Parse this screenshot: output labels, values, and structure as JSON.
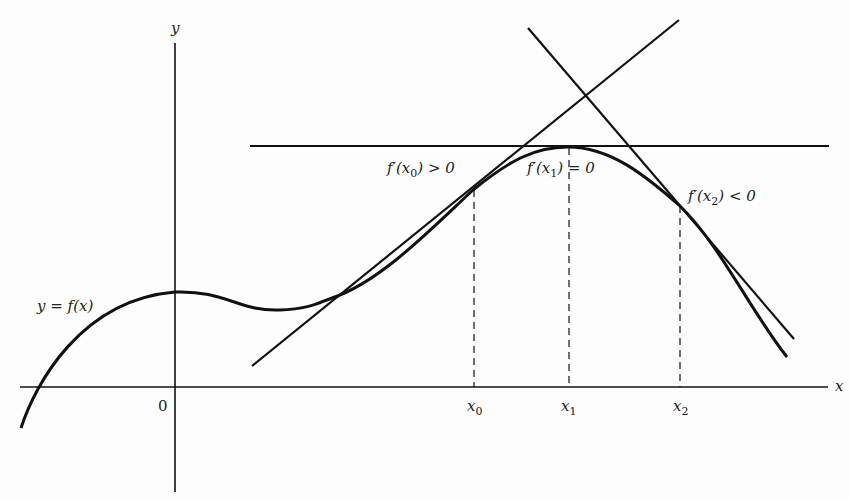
{
  "figure": {
    "axes": {
      "x_label": "x",
      "y_label": "y",
      "origin_label": "0"
    },
    "curve": {
      "label": "y = f(x)"
    },
    "points": [
      {
        "name": "x0",
        "label_base": "x",
        "label_sub": "0"
      },
      {
        "name": "x1",
        "label_base": "x",
        "label_sub": "1"
      },
      {
        "name": "x2",
        "label_base": "x",
        "label_sub": "2"
      }
    ],
    "annotations": [
      {
        "id": "deriv-x0",
        "prefix": "f′(x",
        "sub": "0",
        "suffix": ") > 0"
      },
      {
        "id": "deriv-x1",
        "prefix": "f′(x",
        "sub": "1",
        "suffix": ") = 0"
      },
      {
        "id": "deriv-x2",
        "prefix": "f′(x",
        "sub": "2",
        "suffix": ") < 0"
      }
    ],
    "colors": {
      "ink": "#111111",
      "background": "#fdfdfd"
    }
  }
}
